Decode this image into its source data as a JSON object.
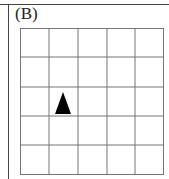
{
  "panel": {
    "label": "(B)"
  },
  "grid": {
    "rows": 5,
    "cols": 5,
    "line_color": "#777777",
    "marker": {
      "shape": "triangle",
      "direction": "up",
      "row": 2,
      "col": 1,
      "color": "#000000"
    }
  }
}
